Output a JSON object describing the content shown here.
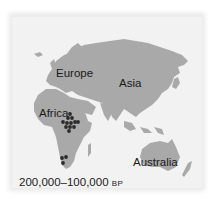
{
  "map": {
    "labels": {
      "europe": "Europe",
      "asia": "Asia",
      "africa": "Africa",
      "australia": "Australia"
    },
    "caption": {
      "range": "200,000–100,000",
      "unit": "BP"
    },
    "colors": {
      "land": "#a9a9a9",
      "water": "#f2f2f2",
      "marker": "#2b2b2b"
    },
    "sites": [
      {
        "region": "East Africa",
        "count": 12
      },
      {
        "region": "Southern Africa",
        "count": 3
      }
    ]
  }
}
